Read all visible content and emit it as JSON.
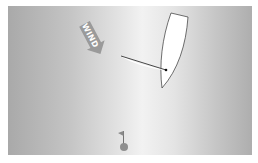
{
  "scene": {
    "type": "sailing-simulation",
    "background": {
      "edge_color": "#a9a9a9",
      "center_color": "#f2f2f2",
      "border_color": "#ffffff"
    }
  },
  "wind_indicator": {
    "label": "WIND",
    "color": "#9a9a9a",
    "text_color": "#ffffff",
    "direction": "down-right"
  },
  "boat": {
    "hull_color": "#ffffff",
    "outline_color": "#333333",
    "mast_color": "#111111",
    "boom_color": "#333333"
  },
  "marker": {
    "flag_color": "#8a8a8a",
    "buoy_color": "#8f8f8f",
    "pole_color": "#555555"
  }
}
